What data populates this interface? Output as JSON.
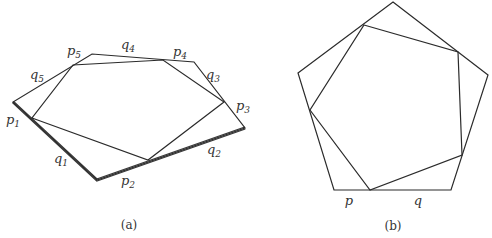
{
  "panel_a": {
    "caption": "(a)",
    "labels": {
      "p1": {
        "base": "p",
        "sub": "1"
      },
      "p2": {
        "base": "p",
        "sub": "2"
      },
      "p3": {
        "base": "p",
        "sub": "3"
      },
      "p4": {
        "base": "p",
        "sub": "4"
      },
      "p5": {
        "base": "p",
        "sub": "5"
      },
      "q1": {
        "base": "q",
        "sub": "1"
      },
      "q2": {
        "base": "q",
        "sub": "2"
      },
      "q3": {
        "base": "q",
        "sub": "3"
      },
      "q4": {
        "base": "q",
        "sub": "4"
      },
      "q5": {
        "base": "q",
        "sub": "5"
      }
    },
    "outer_polygon": [
      [
        13,
        102
      ],
      [
        97,
        180
      ],
      [
        245,
        128
      ],
      [
        194,
        62
      ],
      [
        92,
        54
      ]
    ],
    "inner_polygon": [
      [
        32,
        118
      ],
      [
        148,
        160
      ],
      [
        224,
        102
      ],
      [
        163,
        60
      ],
      [
        73,
        65
      ]
    ]
  },
  "panel_b": {
    "caption": "(b)",
    "labels": {
      "p": "p",
      "q": "q"
    },
    "outer_polygon": [
      [
        393,
        2
      ],
      [
        488,
        75
      ],
      [
        451,
        190
      ],
      [
        334,
        190
      ],
      [
        298,
        73
      ]
    ],
    "inner_polygon": [
      [
        364,
        25
      ],
      [
        458,
        52
      ],
      [
        462,
        155
      ],
      [
        370,
        190
      ],
      [
        310,
        110
      ]
    ]
  }
}
